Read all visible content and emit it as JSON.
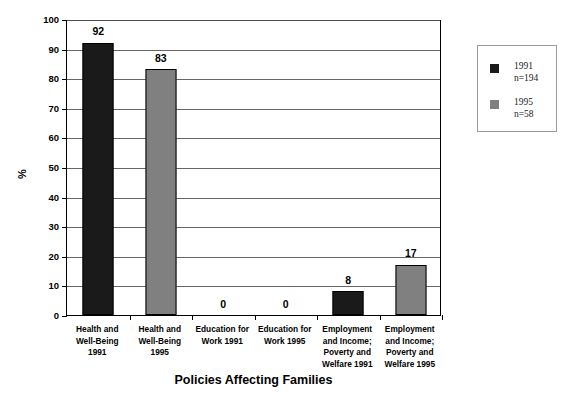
{
  "chart_data": {
    "type": "bar",
    "title": "",
    "xlabel": "Policies Affecting Families",
    "ylabel": "%",
    "ylim": [
      0,
      100
    ],
    "ytick_step": 10,
    "grid": true,
    "legend_position": "right",
    "categories": [
      "Health and Well-Being 1991",
      "Health and Well-Being 1995",
      "Education for Work 1991",
      "Education for Work 1995",
      "Employment and Income; Poverty and Welfare 1991",
      "Employment and Income; Poverty and Welfare 1995"
    ],
    "category_label_lines": [
      [
        "Health and",
        "Well-Being",
        "1991"
      ],
      [
        "Health and",
        "Well-Being",
        "1995"
      ],
      [
        "Education for",
        "Work 1991"
      ],
      [
        "Education for",
        "Work 1995"
      ],
      [
        "Employment",
        "and Income;",
        "Poverty and",
        "Welfare 1991"
      ],
      [
        "Employment",
        "and Income;",
        "Poverty and",
        "Welfare 1995"
      ]
    ],
    "values": [
      92,
      83,
      0,
      0,
      8,
      17
    ],
    "value_labels": [
      "92",
      "83",
      "0",
      "0",
      "8",
      "17"
    ],
    "bar_series": [
      "1991",
      "1995",
      "1991",
      "1995",
      "1991",
      "1995"
    ],
    "ytick_labels": [
      "100",
      "90",
      "80",
      "70",
      "60",
      "50",
      "40",
      "30",
      "20",
      "10",
      "0"
    ],
    "ytick_values": [
      100,
      90,
      80,
      70,
      60,
      50,
      40,
      30,
      20,
      10,
      0
    ],
    "series": [
      {
        "name": "1991",
        "color": "#1a1a1a",
        "values": [
          92,
          null,
          0,
          null,
          8,
          null
        ]
      },
      {
        "name": "1995",
        "color": "#808080",
        "values": [
          null,
          83,
          null,
          0,
          null,
          17
        ]
      }
    ],
    "legend": [
      {
        "label": "1991",
        "sublabel": "n=194",
        "color": "#1a1a1a"
      },
      {
        "label": "1995",
        "sublabel": "n=58",
        "color": "#808080"
      }
    ]
  },
  "colors": {
    "series_1991": "#1a1a1a",
    "series_1995": "#808080",
    "axis": "#000000",
    "gridline": "#666666",
    "legend_border": "#9a9a9a",
    "background": "#ffffff"
  }
}
